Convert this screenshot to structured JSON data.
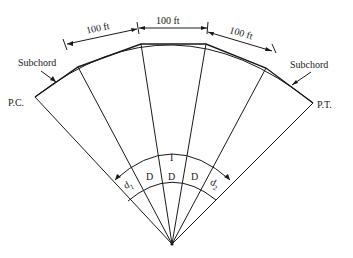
{
  "diagram": {
    "labels": {
      "pc": "P.C.",
      "pt": "P.T.",
      "subchord_left": "Subchord",
      "subchord_right": "Subchord",
      "chord1": "100 ft",
      "chord2": "100 ft",
      "chord3": "100 ft",
      "total_angle": "I",
      "d1": "d",
      "d1_sub": "1",
      "d2": "d",
      "d2_sub": "2",
      "D1": "D",
      "D2": "D",
      "D3": "D"
    },
    "colors": {
      "line": "#1a1a1a",
      "background": "#ffffff"
    }
  }
}
